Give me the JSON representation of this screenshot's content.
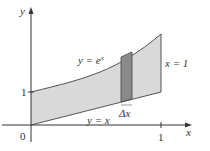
{
  "figure": {
    "axes": {
      "x_label": "x",
      "y_label": "y",
      "origin_label": "0",
      "x_tick_label": "1",
      "y_tick_label": "1"
    },
    "curves": {
      "upper": "y = e",
      "upper_exponent": "x",
      "lower": "y = x",
      "right_boundary": "x = 1"
    },
    "strip": {
      "label": "Δx"
    },
    "colors": {
      "region_fill": "#d9d9d9",
      "strip_fill": "#8a8a8a",
      "curve_stroke": "#555555",
      "axis_stroke": "#333333"
    }
  }
}
